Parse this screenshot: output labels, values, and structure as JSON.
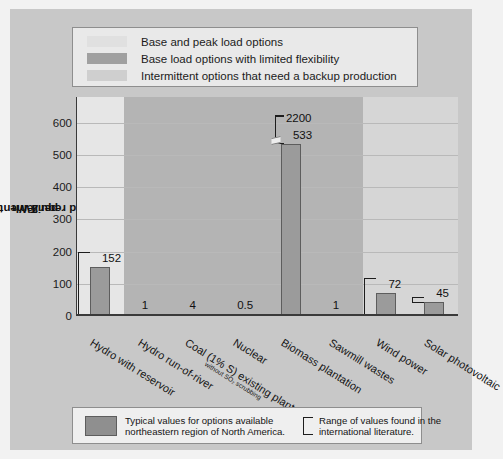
{
  "figure": {
    "background_color": "#c8c8c8",
    "page_color": "#f2f2f2"
  },
  "top_legend": {
    "items": [
      {
        "swatch": "light-gray-swatch",
        "color": "#e0e0e0",
        "label": "Base and peak load options"
      },
      {
        "swatch": "dark-gray-swatch",
        "color": "#a0a0a0",
        "label": "Base load options with limited flexibility"
      },
      {
        "swatch": "mid-gray-swatch",
        "color": "#cfcfcf",
        "label": "Intermittent options that need a backup production"
      }
    ]
  },
  "bottom_legend": {
    "typical_swatch_color": "#8f8f8f",
    "typical_text_line1": "Typical values for options available",
    "typical_text_line2": "northeastern region of North America.",
    "range_text_line1": "Range of values found in the",
    "range_text_line2": "international literature."
  },
  "chart_data": {
    "type": "bar",
    "title": "",
    "xlabel": "",
    "ylabel": "Land requirements/km² per TWh",
    "ylabel_parts": {
      "prefix": "Land requirements/km",
      "sup": "2",
      "suffix": " per TWh"
    },
    "ylim": [
      0,
      680
    ],
    "yticks": [
      0,
      100,
      200,
      300,
      400,
      500,
      600
    ],
    "ytick_labels": [
      "0",
      "100",
      "200",
      "300",
      "400",
      "500",
      "600"
    ],
    "grid": true,
    "legend_position": "top",
    "categories": [
      "Hydro with reservoir",
      "Hydro run-of-river",
      "Coal (1% S) existing plant without SO2 scrubbing",
      "Nuclear",
      "Biomass plantation",
      "Sawmill wastes",
      "Wind power",
      "Solar photovoltaic"
    ],
    "category_labels": [
      {
        "main": "Hydro with reservoir",
        "small": ""
      },
      {
        "main": "Hydro run-of-river",
        "small": ""
      },
      {
        "main": "Coal (1% S) existing plant",
        "small": "without SO₂ scrubbing"
      },
      {
        "main": "Nuclear",
        "small": ""
      },
      {
        "main": "Biomass plantation",
        "small": ""
      },
      {
        "main": "Sawmill wastes",
        "small": ""
      },
      {
        "main": "Wind power",
        "small": ""
      },
      {
        "main": "Solar photovoltaic",
        "small": ""
      }
    ],
    "values": [
      152,
      1,
      4,
      0.5,
      533,
      1,
      72,
      45
    ],
    "value_labels": [
      "152",
      "1",
      "4",
      "0.5",
      "533",
      "1",
      "72",
      "45"
    ],
    "ranges": [
      {
        "category": "Hydro with reservoir",
        "top": 200,
        "bottom": 0,
        "label": ""
      },
      {
        "category": "Biomass plantation",
        "top": 2200,
        "bottom": 533,
        "label": "2200",
        "broken_axis": true
      },
      {
        "category": "Wind power",
        "top": 118,
        "bottom": 0,
        "label": ""
      },
      {
        "category": "Solar photovoltaic",
        "top": 60,
        "bottom": 40,
        "label": ""
      }
    ],
    "bands": [
      {
        "group": "Base and peak load options",
        "color": "#e6e6e6",
        "categories": [
          "Hydro with reservoir"
        ]
      },
      {
        "group": "Base load options with limited flexibility",
        "color": "#b4b4b4",
        "categories": [
          "Hydro run-of-river",
          "Coal (1% S) existing plant without SO2 scrubbing",
          "Nuclear",
          "Biomass plantation",
          "Sawmill wastes"
        ]
      },
      {
        "group": "Intermittent options that need a backup production",
        "color": "#d6d6d6",
        "categories": [
          "Wind power",
          "Solar photovoltaic"
        ]
      }
    ],
    "bar_color": "#9b9b9b",
    "bar_edge_color": "#5d5d5d"
  }
}
